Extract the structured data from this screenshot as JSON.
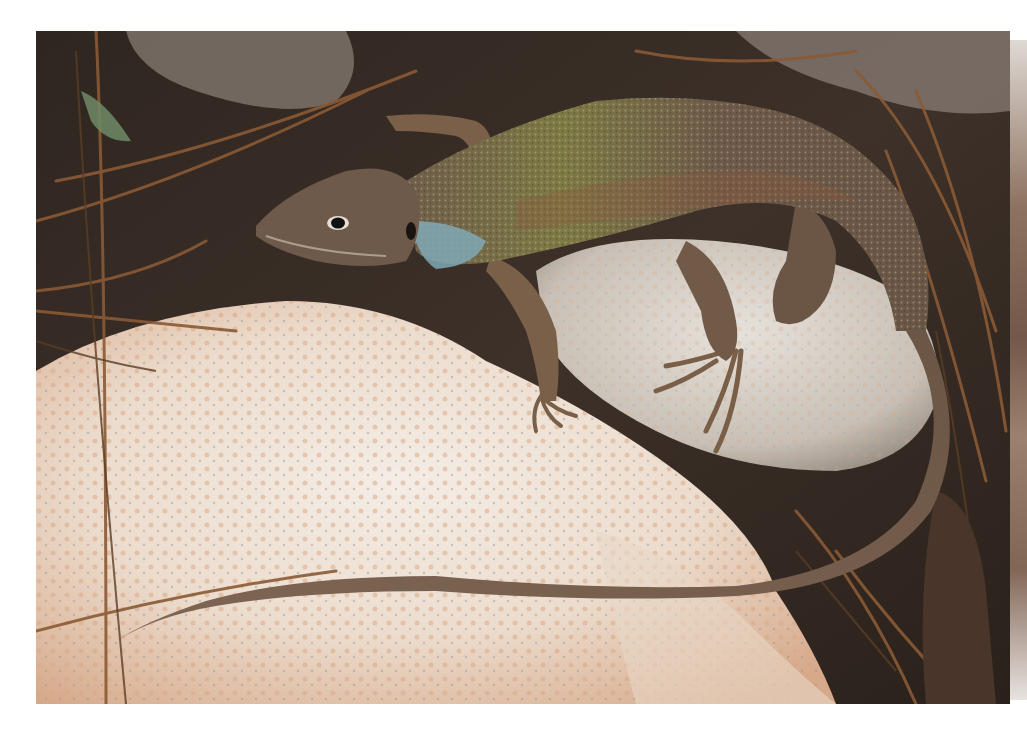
{
  "image": {
    "subject": "lizard on rock",
    "description": "Lizard with speckled greenish-brown dorsal scales and a blue-tinted throat patch, resting across pale pinkish-white rocks among dry pine needles",
    "colors": {
      "page_background": "#ffffff",
      "rock_light": "#efe6de",
      "rock_pink": "#d9a887",
      "rock_grey": "#c9c3bb",
      "soil_dark": "#3a2f26",
      "lizard_body": "#6e5a47",
      "lizard_dorsal_green": "#8a8a4a",
      "lizard_throat_blue": "#7fa9b5",
      "pine_needle": "#8a5a35"
    }
  }
}
